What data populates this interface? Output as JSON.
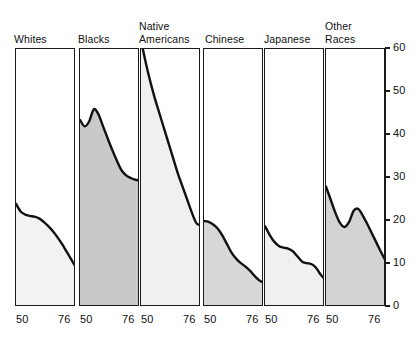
{
  "chart_data": {
    "type": "area",
    "title": "",
    "subtitle": "",
    "xlabel": "",
    "ylabel": "",
    "xlim": [
      50,
      76
    ],
    "ylim": [
      0,
      60
    ],
    "xtick_labels": [
      "50",
      "76"
    ],
    "ytick_labels": [
      "0",
      "10",
      "20",
      "30",
      "40",
      "50",
      "60"
    ],
    "ytick_values": [
      0,
      10,
      20,
      30,
      40,
      50,
      60
    ],
    "grid": false,
    "legend": "none",
    "panel_layout": "small-multiples-row",
    "shared_y_axis_position": "right",
    "panels": [
      {
        "label": "Whites",
        "fill_color": "#f2f2f2",
        "line_color": "#111111",
        "x": [
          50,
          52,
          54,
          56,
          58,
          60,
          62,
          64,
          66,
          68,
          70,
          72,
          74,
          76
        ],
        "y": [
          24.0,
          22.2,
          21.5,
          21.2,
          21.0,
          20.6,
          19.8,
          18.8,
          17.6,
          16.2,
          14.6,
          12.8,
          11.0,
          9.2
        ]
      },
      {
        "label": "Blacks",
        "fill_color": "#c9c9c9",
        "line_color": "#111111",
        "x": [
          50,
          52,
          54,
          56,
          58,
          60,
          62,
          64,
          66,
          68,
          70,
          72,
          74,
          76
        ],
        "y": [
          43.5,
          42.0,
          43.2,
          46.0,
          44.8,
          42.0,
          39.2,
          36.5,
          34.0,
          31.8,
          30.6,
          30.0,
          29.6,
          29.4
        ]
      },
      {
        "label": "Native\nAmericans",
        "fill_color": "#f0f0f0",
        "line_color": "#111111",
        "x": [
          50,
          52,
          54,
          56,
          58,
          60,
          62,
          64,
          66,
          68,
          70,
          72,
          74,
          76
        ],
        "y": [
          62.0,
          57.0,
          52.5,
          48.5,
          45.0,
          41.5,
          38.0,
          34.5,
          31.0,
          28.0,
          25.0,
          22.0,
          19.5,
          19.0
        ]
      },
      {
        "label": "Chinese",
        "fill_color": "#d7d7d7",
        "line_color": "#111111",
        "x": [
          50,
          52,
          54,
          56,
          58,
          60,
          62,
          64,
          66,
          68,
          70,
          72,
          74,
          76
        ],
        "y": [
          20.0,
          19.8,
          19.2,
          18.2,
          16.6,
          14.6,
          12.6,
          11.2,
          10.2,
          9.4,
          8.4,
          7.2,
          6.2,
          5.6
        ]
      },
      {
        "label": "Japanese",
        "fill_color": "#f0f0f0",
        "line_color": "#111111",
        "x": [
          50,
          52,
          54,
          56,
          58,
          60,
          62,
          64,
          66,
          68,
          70,
          72,
          74,
          76
        ],
        "y": [
          18.8,
          16.8,
          15.2,
          14.2,
          13.8,
          13.6,
          13.0,
          11.8,
          10.6,
          10.2,
          10.0,
          9.2,
          7.6,
          6.4
        ]
      },
      {
        "label": "Other\nRaces",
        "fill_color": "#d2d2d2",
        "line_color": "#111111",
        "x": [
          50,
          52,
          54,
          56,
          58,
          60,
          62,
          64,
          66,
          68,
          70,
          72,
          74,
          76
        ],
        "y": [
          28.0,
          25.0,
          22.0,
          19.6,
          18.6,
          19.8,
          22.4,
          22.8,
          21.2,
          19.2,
          17.0,
          14.8,
          12.6,
          10.6
        ]
      }
    ]
  },
  "axis": {
    "y_axis_name": "percent-scale",
    "x_axis_name": "year-scale"
  }
}
